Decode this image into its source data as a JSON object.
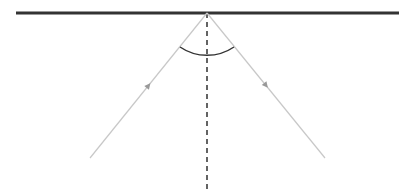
{
  "diagram": {
    "type": "reflection",
    "colors": {
      "surface": "#333333",
      "rays": "#c8c8c8",
      "arrows": "#999999",
      "normal": "#222222",
      "angle_arc": "#333333"
    },
    "surface": {
      "x1": 16,
      "y1": 13,
      "x2": 399,
      "y2": 13,
      "width": 3
    },
    "point_of_incidence": {
      "x": 207,
      "y": 13
    },
    "normal": {
      "x1": 207,
      "y1": 13,
      "x2": 207,
      "y2": 190,
      "dash": "5,4"
    },
    "incident_ray": {
      "x1": 90,
      "y1": 158,
      "x2": 207,
      "y2": 13
    },
    "reflected_ray": {
      "x1": 207,
      "y1": 13,
      "x2": 325,
      "y2": 158
    },
    "angle_arc": {
      "start_x": 180,
      "start_y": 47,
      "end_x": 234,
      "end_y": 47,
      "radius": 48
    }
  }
}
